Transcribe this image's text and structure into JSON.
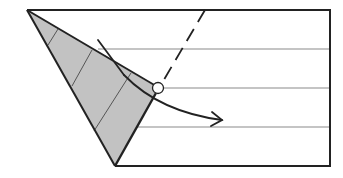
{
  "diagram": {
    "colors": {
      "background": "#ffffff",
      "outline": "#222222",
      "crease": "#b0b0b0",
      "shade": "#c2c2c2",
      "shade_crease": "#555555"
    },
    "paper": {
      "top_left": [
        27,
        10
      ],
      "top_right": [
        330,
        10
      ],
      "bottom_right": [
        330,
        166
      ],
      "bottom_left": [
        115,
        166
      ]
    },
    "creases_y": [
      49,
      88,
      127
    ],
    "flap": {
      "points": [
        [
          27,
          10
        ],
        [
          158,
          88
        ],
        [
          115,
          166
        ]
      ]
    },
    "reference_point": {
      "cx": 158,
      "cy": 88,
      "r": 6
    },
    "dashed_fold_line": {
      "from": [
        205,
        10
      ],
      "to": [
        161,
        84
      ]
    },
    "arrow": {
      "path": "M98,40 Q150,105 222,120",
      "direction": "right-down"
    }
  }
}
